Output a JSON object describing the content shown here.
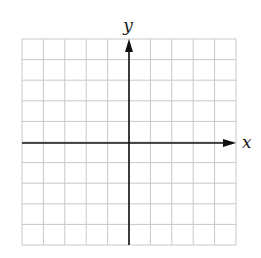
{
  "diagram": {
    "type": "coordinate-grid",
    "labels": {
      "x_axis": "x",
      "y_axis": "y"
    },
    "grid": {
      "columns": 10,
      "rows": 10,
      "left": 22,
      "right": 236,
      "top": 39,
      "bottom": 245,
      "color": "#c8c8c8"
    },
    "axes": {
      "origin_x": 129,
      "origin_y": 143,
      "color": "#111111",
      "x_arrow": "right",
      "y_arrow": "up"
    },
    "background": "#ffffff"
  }
}
